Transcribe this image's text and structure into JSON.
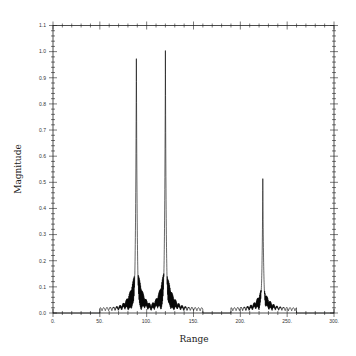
{
  "chart_data": {
    "type": "line",
    "title": "",
    "xlabel": "Range",
    "ylabel": "Magnitude",
    "xlim": [
      0,
      300
    ],
    "ylim": [
      0.0,
      1.1
    ],
    "x_ticks": [
      0,
      50,
      100,
      150,
      200,
      250,
      300
    ],
    "x_tick_labels": [
      "0.",
      "50.",
      "100.",
      "150.",
      "200.",
      "250.",
      "300."
    ],
    "y_ticks": [
      0.0,
      0.1,
      0.2,
      0.3,
      0.4,
      0.5,
      0.6,
      0.7,
      0.8,
      0.9,
      1.0,
      1.1
    ],
    "y_tick_labels": [
      "0.0",
      "0.1",
      "0.2",
      "0.3",
      "0.4",
      "0.5",
      "0.6",
      "0.7",
      "0.8",
      "0.9",
      "1.0",
      "1.1"
    ],
    "grid": false,
    "legend": null,
    "series": [
      {
        "name": "Magnitude",
        "color": "#000000",
        "peaks": [
          {
            "x": 89,
            "y": 1.0
          },
          {
            "x": 120,
            "y": 0.985
          },
          {
            "x": 224,
            "y": 0.5
          }
        ],
        "support_ranges": [
          [
            50,
            160
          ],
          [
            190,
            260
          ]
        ],
        "noise_floor": 0.0
      }
    ]
  },
  "labels": {
    "xlabel": "Range",
    "ylabel": "Magnitude"
  }
}
